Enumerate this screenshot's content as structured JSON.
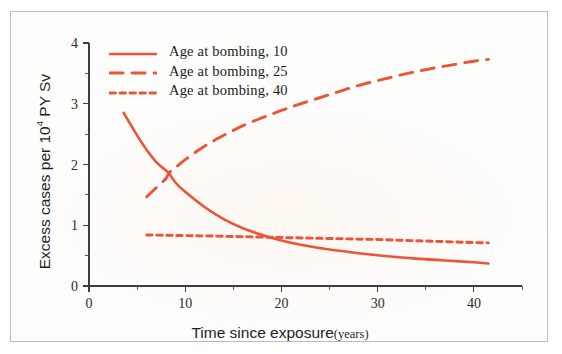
{
  "chart_data": {
    "type": "line",
    "title": "",
    "xlabel": "Time since exposure",
    "xlabel_unit": "(years)",
    "ylabel_prefix": "Excess cases per 10",
    "ylabel_exponent": "4",
    "ylabel_suffix": " PY Sv",
    "ylabel_full": "Excess cases per 10^4 PY Sv",
    "xlim": [
      0,
      45
    ],
    "ylim": [
      0,
      4
    ],
    "xticks": [
      0,
      10,
      20,
      30,
      40
    ],
    "xtick_labels": [
      "0",
      "10",
      "20",
      "30",
      "40"
    ],
    "xticks_minor": [
      5,
      15,
      25,
      35,
      45
    ],
    "yticks": [
      0,
      1,
      2,
      3,
      4
    ],
    "ytick_labels": [
      "0",
      "1",
      "2",
      "3",
      "4"
    ],
    "yticks_minor": [
      0.5,
      1.5,
      2.5,
      3.5
    ],
    "grid": false,
    "legend_position": "top-left",
    "line_color": "#ea5437",
    "series": [
      {
        "name": "Age at bombing, 10",
        "style": "solid",
        "x": [
          3.6,
          5,
          6,
          7,
          8,
          8.3,
          9,
          10,
          12,
          14,
          16,
          18,
          20,
          22,
          25,
          28,
          31,
          34,
          37,
          40,
          41.5
        ],
        "values": [
          2.85,
          2.48,
          2.24,
          2.04,
          1.9,
          1.86,
          1.7,
          1.55,
          1.3,
          1.1,
          0.95,
          0.84,
          0.75,
          0.68,
          0.6,
          0.54,
          0.49,
          0.45,
          0.42,
          0.39,
          0.37
        ]
      },
      {
        "name": "Age at bombing, 25",
        "style": "dashed",
        "x": [
          6,
          7,
          8,
          8.3,
          9,
          10,
          12,
          14,
          16,
          18,
          20,
          22,
          25,
          28,
          31,
          34,
          37,
          40,
          41.5
        ],
        "values": [
          1.47,
          1.62,
          1.77,
          1.86,
          1.95,
          2.08,
          2.3,
          2.48,
          2.64,
          2.77,
          2.89,
          3.0,
          3.15,
          3.3,
          3.42,
          3.53,
          3.62,
          3.7,
          3.73
        ]
      },
      {
        "name": "Age at bombing, 40",
        "style": "dotted",
        "x": [
          6,
          8,
          10,
          12,
          15,
          18,
          21,
          24,
          27,
          30,
          33,
          36,
          39,
          41.5
        ],
        "values": [
          0.84,
          0.835,
          0.83,
          0.825,
          0.815,
          0.805,
          0.795,
          0.785,
          0.775,
          0.765,
          0.75,
          0.735,
          0.72,
          0.71
        ]
      }
    ],
    "legend": [
      {
        "label": "Age at bombing, 10",
        "style": "solid"
      },
      {
        "label": "Age at bombing, 25",
        "style": "dashed"
      },
      {
        "label": "Age at bombing, 40",
        "style": "dotted"
      }
    ]
  }
}
